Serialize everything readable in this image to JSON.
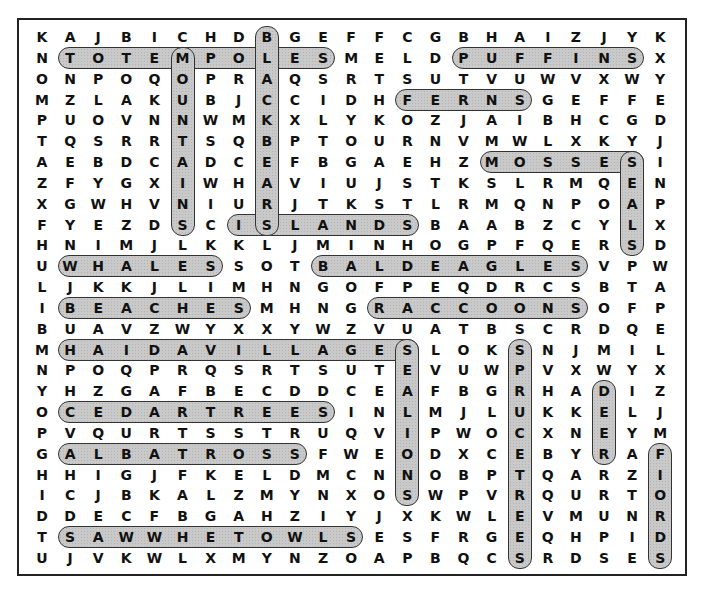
{
  "puzzle": {
    "type": "word-search",
    "rows": 26,
    "cols": 23,
    "highlight_color": "#c9c9c9",
    "grid": [
      "KAJBICHDBGEFFCGBHAIZJYK",
      "NTOTEMPOLESMELDPUFFINSX",
      "ONPOQOPRAQSRTSUTVUWVXWY",
      "MZLAKUBJCCIDHFERNSGEFFE",
      "PUOVNNWMKXLYKOZJAIBHCGD",
      "TQSRRTSQBPTOURNVMWLXKYJ",
      "AEBDCADCEFBGAEHZMOSSESI",
      "ZFYGXIWHAVIUJSTKSLRMQEN",
      "XGWHVNIURJTKSTLRMQNPOAP",
      "FYEZDSCISLANDSBAABZCYLX",
      "HNIMJLKKLJMINHOGPFQERSD",
      "UWHALESSOTBALDEAGLESVPW",
      "LJKKJLIMHNGOFPEQDRCSBTA",
      "IBEACHESMHNGRACCOONSOFP",
      "BUAVZWYXXYWZVUATBSCRDQE",
      "MHAIDAVILLAGESLOKSNJMIL",
      "NPOQPRQSRTSUTEVUWPVXWYX",
      "YHZGAFBECDDCEAFBGRHADIZ",
      "OCEDARTREESINLMJLUKKELJ",
      "PVQURTSSTRUQVIPWOCXNEYM",
      "GALBATROSSFWEODXCEBYRAF",
      "HHIGJFKELDMCNNOBPTQARZI",
      "ICJBKALZMYNXOSWPVRQURTO",
      "DDECFBGAHZIYJXKWLEVMUNR",
      "TSAWWHETOWLSESFRGEQHPID",
      "UJVKWLXMYNZOAPBQCSRDSES"
    ],
    "found_words": [
      {
        "word": "TOTEMPOLES",
        "dir": "h",
        "row": 2,
        "start": 2,
        "end": 11
      },
      {
        "word": "PUFFINS",
        "dir": "h",
        "row": 2,
        "start": 16,
        "end": 22
      },
      {
        "word": "FERNS",
        "dir": "h",
        "row": 4,
        "start": 14,
        "end": 18
      },
      {
        "word": "MOSSES",
        "dir": "h",
        "row": 7,
        "start": 17,
        "end": 22
      },
      {
        "word": "ISLANDS",
        "dir": "h",
        "row": 10,
        "start": 8,
        "end": 14
      },
      {
        "word": "WHALES",
        "dir": "h",
        "row": 12,
        "start": 2,
        "end": 7
      },
      {
        "word": "BALDEAGLES",
        "dir": "h",
        "row": 12,
        "start": 11,
        "end": 20
      },
      {
        "word": "BEACHES",
        "dir": "h",
        "row": 14,
        "start": 2,
        "end": 8
      },
      {
        "word": "RACCOONS",
        "dir": "h",
        "row": 14,
        "start": 13,
        "end": 20
      },
      {
        "word": "HAIDAVILLAGES",
        "dir": "h",
        "row": 16,
        "start": 2,
        "end": 14
      },
      {
        "word": "CEDARTREES",
        "dir": "h",
        "row": 19,
        "start": 2,
        "end": 11
      },
      {
        "word": "ALBATROSS",
        "dir": "h",
        "row": 21,
        "start": 2,
        "end": 10
      },
      {
        "word": "SAWWHETOWLS",
        "dir": "h",
        "row": 25,
        "start": 2,
        "end": 12
      },
      {
        "word": "MOUNTAINS",
        "dir": "v",
        "col": 6,
        "start": 2,
        "end": 10
      },
      {
        "word": "BLACKBEARS",
        "dir": "v",
        "col": 9,
        "start": 1,
        "end": 10
      },
      {
        "word": "SEALS",
        "dir": "v",
        "col": 22,
        "start": 7,
        "end": 11
      },
      {
        "word": "SEALIONS",
        "dir": "v",
        "col": 14,
        "start": 16,
        "end": 23
      },
      {
        "word": "SPRUCETREES",
        "dir": "v",
        "col": 18,
        "start": 16,
        "end": 26
      },
      {
        "word": "DEER",
        "dir": "v",
        "col": 21,
        "start": 18,
        "end": 21
      },
      {
        "word": "FIORDS",
        "dir": "v",
        "col": 23,
        "start": 21,
        "end": 26
      }
    ]
  }
}
